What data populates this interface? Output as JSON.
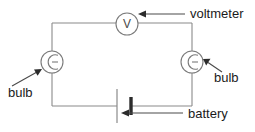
{
  "diagram": {
    "background_color": "#ffffff",
    "wire_color": "#8a8a8a",
    "component_color": "#7a7a7a",
    "annotation_color": "#4a4a4a",
    "text_color": "#1a1a1a"
  },
  "circuit": {
    "loop": {
      "left_x": 52,
      "right_x": 192,
      "top_y": 23,
      "bottom_y": 106
    }
  },
  "components": [
    {
      "id": "voltmeter",
      "type": "voltmeter",
      "symbol_letter": "V",
      "cx": 127,
      "cy": 24,
      "r": 11,
      "on_wire": "top"
    },
    {
      "id": "bulb-left",
      "type": "bulb",
      "cx": 52,
      "cy": 62,
      "r": 11,
      "on_wire": "left"
    },
    {
      "id": "bulb-right",
      "type": "bulb",
      "cx": 192,
      "cy": 62,
      "r": 11,
      "on_wire": "right"
    },
    {
      "id": "battery",
      "type": "battery",
      "cx": 124,
      "cy": 106,
      "long_plate_x": 117,
      "long_plate_half_height": 17,
      "short_plate_x": 131,
      "short_plate_half_height": 9,
      "on_wire": "bottom"
    }
  ],
  "annotations": [
    {
      "id": "voltmeter-label",
      "text": "voltmeter",
      "text_x": 190,
      "text_y": 18,
      "anchor": "start",
      "leader": {
        "x1": 185,
        "y1": 14,
        "x2": 141,
        "y2": 14
      },
      "arrow_points_to": "voltmeter"
    },
    {
      "id": "bulb-left-label",
      "text": "bulb",
      "text_x": 8,
      "text_y": 97,
      "anchor": "start",
      "leader": {
        "x1": 12,
        "y1": 86,
        "x2": 40,
        "y2": 70
      },
      "arrow_points_to": "bulb-left"
    },
    {
      "id": "bulb-right-label",
      "text": "bulb",
      "text_x": 214,
      "text_y": 82,
      "anchor": "start",
      "leader": {
        "x1": 222,
        "y1": 72,
        "x2": 204,
        "y2": 60
      },
      "arrow_points_to": "bulb-right"
    },
    {
      "id": "battery-label",
      "text": "battery",
      "text_x": 188,
      "text_y": 118,
      "anchor": "start",
      "leader": {
        "x1": 183,
        "y1": 113,
        "x2": 122,
        "y2": 113
      },
      "arrow_points_to": "battery"
    }
  ]
}
